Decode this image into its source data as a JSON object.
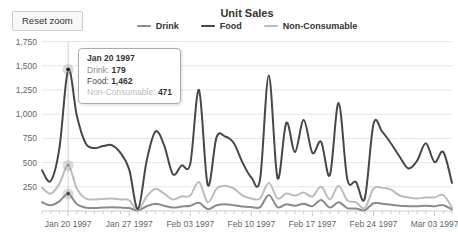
{
  "ui": {
    "reset_button_label": "Reset zoom"
  },
  "tooltip": {
    "date": "Jan 20 1997",
    "rows": [
      {
        "label": "Drink:",
        "value": "179"
      },
      {
        "label": "Food:",
        "value": "1,462"
      },
      {
        "label": "Non-Consumable:",
        "value": "471"
      }
    ]
  },
  "chart_data": {
    "type": "line",
    "title": "Unit Sales",
    "legend_position": "top",
    "grid": "horizontal-only",
    "ylim": [
      0,
      1750
    ],
    "y_tick_values": [
      250,
      500,
      750,
      1000,
      1250,
      1500,
      1750
    ],
    "y_tick_labels": [
      "250",
      "500",
      "750",
      "1,000",
      "1,250",
      "1,500",
      "1,750"
    ],
    "x_tick_indices": [
      3,
      10,
      17,
      24,
      31,
      38,
      45
    ],
    "x_tick_labels": [
      "Jan 20 1997",
      "Jan 27 1997",
      "Feb 03 1997",
      "Feb 10 1997",
      "Feb 17 1997",
      "Feb 24 1997",
      "Mar 03 1997"
    ],
    "hover_index": 3,
    "x": [
      "Jan 17 1997",
      "Jan 18 1997",
      "Jan 19 1997",
      "Jan 20 1997",
      "Jan 21 1997",
      "Jan 22 1997",
      "Jan 23 1997",
      "Jan 24 1997",
      "Jan 25 1997",
      "Jan 26 1997",
      "Jan 27 1997",
      "Jan 28 1997",
      "Jan 29 1997",
      "Jan 30 1997",
      "Jan 31 1997",
      "Feb 01 1997",
      "Feb 02 1997",
      "Feb 03 1997",
      "Feb 04 1997",
      "Feb 05 1997",
      "Feb 06 1997",
      "Feb 07 1997",
      "Feb 08 1997",
      "Feb 09 1997",
      "Feb 10 1997",
      "Feb 11 1997",
      "Feb 12 1997",
      "Feb 13 1997",
      "Feb 14 1997",
      "Feb 15 1997",
      "Feb 16 1997",
      "Feb 17 1997",
      "Feb 18 1997",
      "Feb 19 1997",
      "Feb 20 1997",
      "Feb 21 1997",
      "Feb 22 1997",
      "Feb 23 1997",
      "Feb 24 1997",
      "Feb 25 1997",
      "Feb 26 1997",
      "Feb 27 1997",
      "Feb 28 1997",
      "Mar 01 1997",
      "Mar 02 1997",
      "Mar 03 1997",
      "Mar 04 1997",
      "Mar 05 1997"
    ],
    "series": [
      {
        "name": "Drink",
        "color": "#8a8a8a",
        "dot_color": "#4a4a4a",
        "values": [
          90,
          60,
          100,
          179,
          70,
          35,
          30,
          35,
          38,
          35,
          30,
          5,
          50,
          75,
          55,
          35,
          45,
          55,
          85,
          20,
          60,
          70,
          60,
          45,
          40,
          40,
          165,
          40,
          70,
          55,
          75,
          50,
          115,
          35,
          90,
          30,
          25,
          8,
          80,
          75,
          65,
          55,
          50,
          50,
          55,
          50,
          60,
          15
        ]
      },
      {
        "name": "Food",
        "color": "#474747",
        "dot_color": "#1f1f1f",
        "values": [
          420,
          310,
          650,
          1462,
          980,
          700,
          650,
          670,
          680,
          600,
          430,
          20,
          520,
          820,
          680,
          380,
          470,
          490,
          1250,
          270,
          760,
          770,
          700,
          500,
          345,
          330,
          1400,
          340,
          910,
          610,
          940,
          600,
          715,
          370,
          1115,
          330,
          300,
          130,
          900,
          820,
          700,
          560,
          440,
          520,
          700,
          505,
          610,
          290
        ]
      },
      {
        "name": "Non-Consumable",
        "color": "#bcbcbc",
        "dot_color": "#999999",
        "values": [
          240,
          180,
          280,
          471,
          230,
          130,
          120,
          125,
          130,
          120,
          110,
          10,
          150,
          230,
          180,
          120,
          150,
          160,
          300,
          90,
          230,
          260,
          230,
          160,
          130,
          130,
          290,
          130,
          180,
          160,
          190,
          150,
          250,
          120,
          260,
          110,
          90,
          30,
          230,
          240,
          220,
          160,
          140,
          130,
          140,
          140,
          165,
          35
        ]
      }
    ]
  }
}
